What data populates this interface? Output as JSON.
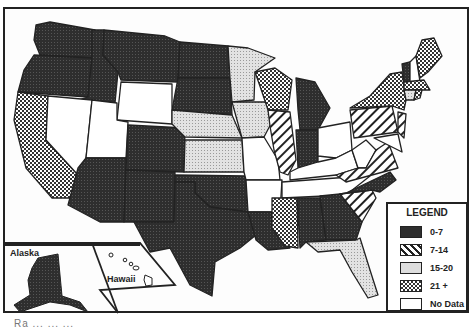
{
  "map": {
    "title": "",
    "insets": {
      "alaska_label": "Alaska",
      "hawaii_label": "Hawaii"
    },
    "legend": {
      "title": "LEGEND",
      "items": [
        {
          "label": "0-7",
          "pattern": "dark"
        },
        {
          "label": "7-14",
          "pattern": "hatch"
        },
        {
          "label": "15-20",
          "pattern": "light"
        },
        {
          "label": "21 +",
          "pattern": "checker"
        },
        {
          "label": "No Data",
          "pattern": "blank"
        }
      ]
    },
    "states": {
      "dark": [
        "WA",
        "OR",
        "ID",
        "MT",
        "ND",
        "SD",
        "NV_no",
        "AZ",
        "NM",
        "CO",
        "TX",
        "OK",
        "LA",
        "MI",
        "IN",
        "AL",
        "GA",
        "NC",
        "AK",
        "VT"
      ],
      "hatch": [
        "IL",
        "PA",
        "VA",
        "SC",
        "NJ",
        "NH"
      ],
      "light": [
        "MN",
        "NE",
        "KS",
        "IA",
        "FL",
        "RI"
      ],
      "checker": [
        "CA",
        "WI",
        "MS",
        "NY",
        "ME",
        "MA",
        "CT"
      ],
      "blank": [
        "WY",
        "UT",
        "NV",
        "MO",
        "AR",
        "KY",
        "TN",
        "OH",
        "WV",
        "HI",
        "MD",
        "DE"
      ]
    },
    "colors": {
      "dark": "#2b2b2b",
      "border": "#222222",
      "light": "#d8d8d8",
      "blank": "#ffffff"
    }
  },
  "footer": {
    "text": "Ra ...  ...  ..."
  }
}
